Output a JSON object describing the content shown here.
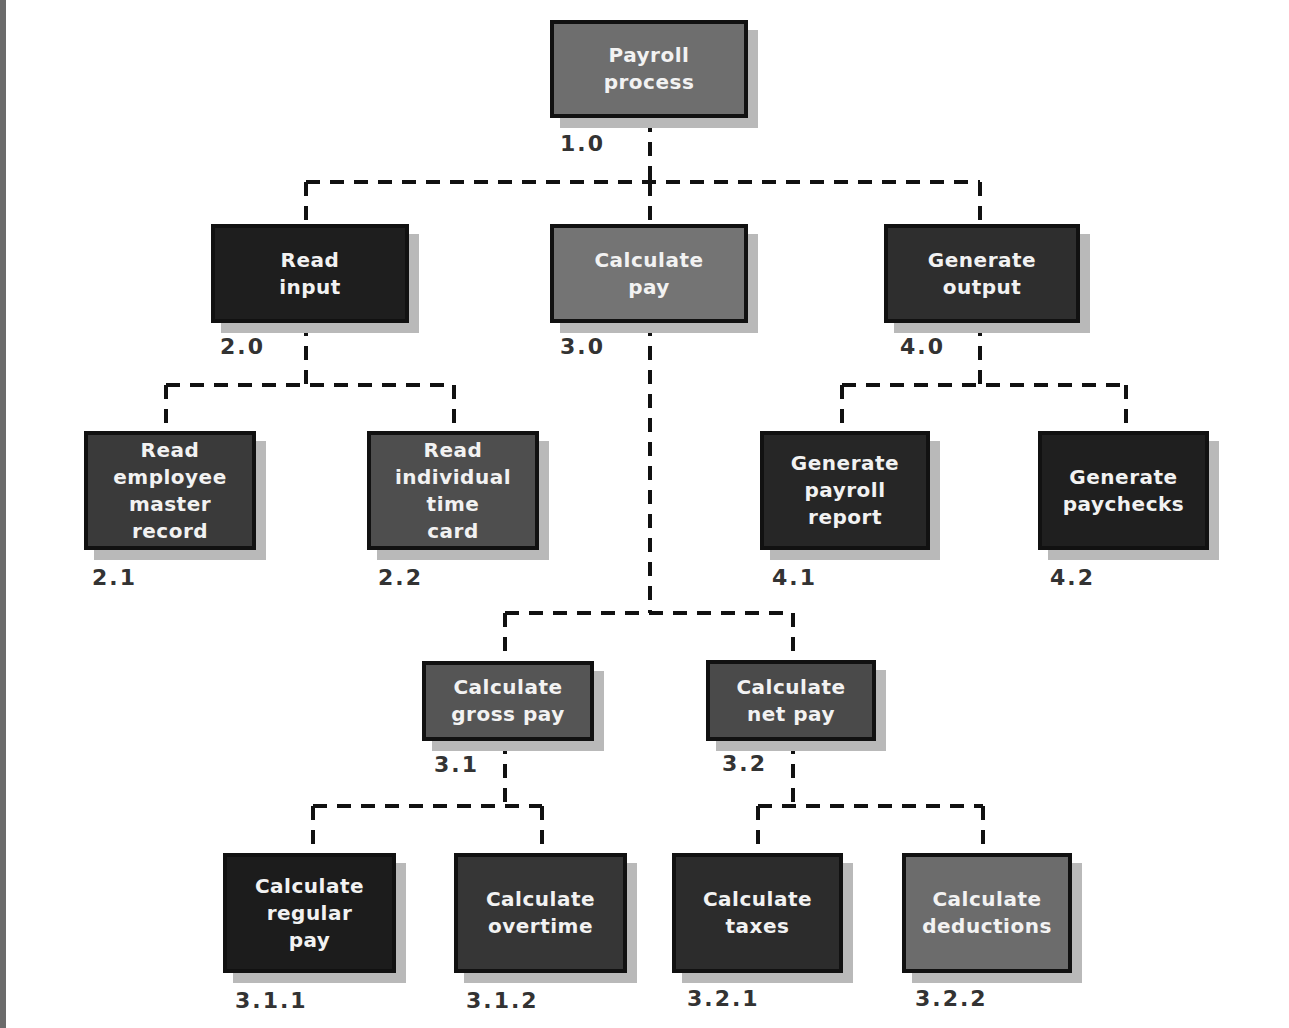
{
  "diagram": {
    "type": "hierarchy-chart",
    "colors": {
      "light": "#6e6e6e",
      "medium": "#454545",
      "dark": "#2a2a2a",
      "darkest": "#1e1e1e",
      "border": "#111111",
      "shadow": "#b9b9b9",
      "connector": "#111111"
    },
    "nodes": {
      "n1_0": {
        "label": "Payroll\nprocess",
        "number": "1.0"
      },
      "n2_0": {
        "label": "Read\ninput",
        "number": "2.0"
      },
      "n3_0": {
        "label": "Calculate\npay",
        "number": "3.0"
      },
      "n4_0": {
        "label": "Generate\noutput",
        "number": "4.0"
      },
      "n2_1": {
        "label": "Read\nemployee\nmaster\nrecord",
        "number": "2.1"
      },
      "n2_2": {
        "label": "Read\nindividual\ntime\ncard",
        "number": "2.2"
      },
      "n4_1": {
        "label": "Generate\npayroll\nreport",
        "number": "4.1"
      },
      "n4_2": {
        "label": "Generate\npaychecks",
        "number": "4.2"
      },
      "n3_1": {
        "label": "Calculate\ngross pay",
        "number": "3.1"
      },
      "n3_2": {
        "label": "Calculate\nnet pay",
        "number": "3.2"
      },
      "n3_1_1": {
        "label": "Calculate\nregular\npay",
        "number": "3.1.1"
      },
      "n3_1_2": {
        "label": "Calculate\novertime",
        "number": "3.1.2"
      },
      "n3_2_1": {
        "label": "Calculate\ntaxes",
        "number": "3.2.1"
      },
      "n3_2_2": {
        "label": "Calculate\ndeductions",
        "number": "3.2.2"
      }
    },
    "edges": [
      [
        "1.0",
        "2.0"
      ],
      [
        "1.0",
        "3.0"
      ],
      [
        "1.0",
        "4.0"
      ],
      [
        "2.0",
        "2.1"
      ],
      [
        "2.0",
        "2.2"
      ],
      [
        "3.0",
        "3.1"
      ],
      [
        "3.0",
        "3.2"
      ],
      [
        "4.0",
        "4.1"
      ],
      [
        "4.0",
        "4.2"
      ],
      [
        "3.1",
        "3.1.1"
      ],
      [
        "3.1",
        "3.1.2"
      ],
      [
        "3.2",
        "3.2.1"
      ],
      [
        "3.2",
        "3.2.2"
      ]
    ]
  }
}
